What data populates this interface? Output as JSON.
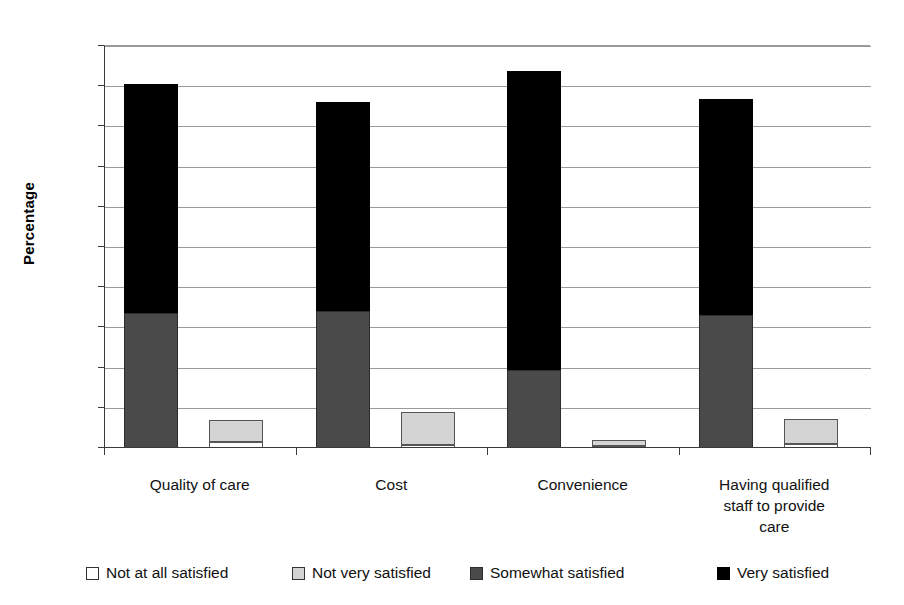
{
  "chart_data": {
    "type": "bar",
    "title": "",
    "xlabel": "",
    "ylabel": "Percentage",
    "ylim": [
      0,
      100
    ],
    "ytick_step": 10,
    "yticks": [
      0,
      10,
      20,
      30,
      40,
      50,
      60,
      70,
      80,
      90,
      100
    ],
    "grid": true,
    "legend_position": "bottom",
    "stacked": true,
    "categories": [
      "Quality of care",
      "Cost",
      "Convenience",
      "Having qualified staff to provide care"
    ],
    "series": [
      {
        "name": "Not at all satisfied",
        "color": "#ffffff",
        "values": [
          1.5,
          0.8,
          0.5,
          1.0
        ]
      },
      {
        "name": "Not very satisfied",
        "color": "#d4d4d4",
        "values": [
          5.5,
          8.2,
          1.5,
          6.3
        ]
      },
      {
        "name": "Somewhat satisfied",
        "color": "#4a4a4a",
        "values": [
          33.5,
          34.0,
          19.3,
          33.0
        ]
      },
      {
        "name": "Very satisfied",
        "color": "#000000",
        "values": [
          57.0,
          52.0,
          74.5,
          53.8
        ]
      }
    ],
    "group_totals_satisfied_stack": [
      91.0,
      86.0,
      93.8,
      87.0
    ],
    "group_totals_dissatisfied_stack": [
      7.0,
      9.0,
      2.0,
      7.3
    ]
  },
  "axis": {
    "y_title": "Percentage",
    "tick_labels": [
      "100",
      "90",
      "80",
      "70",
      "60",
      "50",
      "40",
      "30",
      "20",
      "10",
      "0"
    ]
  },
  "legend": {
    "items": [
      {
        "label": "Not at all satisfied",
        "swatch": "white-square-icon"
      },
      {
        "label": "Not very satisfied",
        "swatch": "light-gray-square-icon"
      },
      {
        "label": "Somewhat satisfied",
        "swatch": "dark-gray-square-icon"
      },
      {
        "label": "Very satisfied",
        "swatch": "black-square-icon"
      }
    ]
  },
  "categories_display": [
    {
      "lines": [
        "Quality of care"
      ]
    },
    {
      "lines": [
        "Cost"
      ]
    },
    {
      "lines": [
        "Convenience"
      ]
    },
    {
      "lines": [
        "Having qualified",
        "staff to provide",
        "care"
      ]
    }
  ]
}
